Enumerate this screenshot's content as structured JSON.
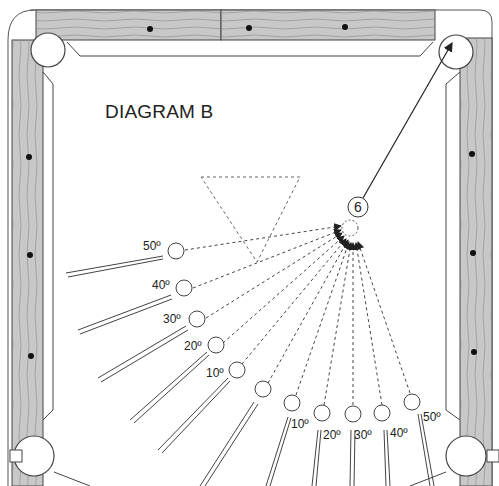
{
  "diagram": {
    "title": "DIAGRAM B",
    "object_ball": {
      "label": "6",
      "target": "top-right corner pocket"
    },
    "left_group": {
      "labels": [
        "50º",
        "40º",
        "30º",
        "20º",
        "10º"
      ]
    },
    "bottom_group": {
      "labels": [
        "10º",
        "20º",
        "30º",
        "40º",
        "50º"
      ]
    },
    "colors": {
      "rail": "#c8c8c8",
      "line": "#333333",
      "felt": "#ffffff"
    }
  }
}
